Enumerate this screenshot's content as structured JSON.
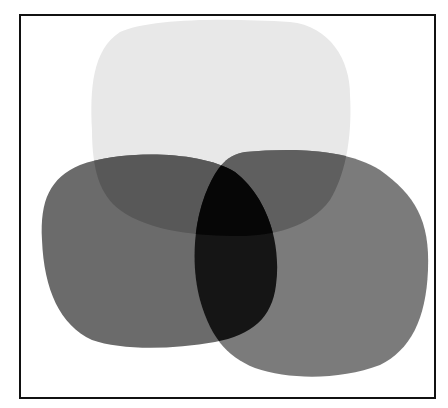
{
  "diagram": {
    "type": "overlapping-blobs",
    "frame": {
      "border_color": "#111111",
      "background": "#ffffff"
    },
    "shapes": [
      {
        "name": "top-blob",
        "fill": "#e6e6e6"
      },
      {
        "name": "left-blob",
        "fill": "#6a6a6a"
      },
      {
        "name": "right-blob",
        "fill": "#7a7a7a"
      }
    ],
    "overlap_colors": {
      "top-left": "#555555",
      "top-right": "#5c5c5c",
      "left-right": "#151515",
      "all-three": "#050505"
    }
  }
}
